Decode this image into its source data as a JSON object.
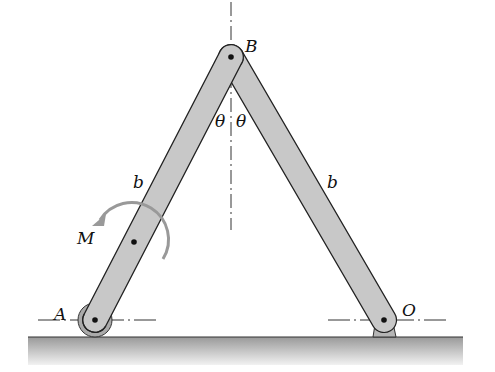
{
  "diagram": {
    "labels": {
      "B": "B",
      "A": "A",
      "O": "O",
      "left_length": "b",
      "right_length": "b",
      "theta_left": "θ",
      "theta_right": "θ",
      "moment": "M"
    },
    "colors": {
      "bar_fill": "#c8c8c8",
      "outline": "#222222",
      "ground": "#b0b0b0",
      "moment_arrow": "#999999"
    }
  }
}
